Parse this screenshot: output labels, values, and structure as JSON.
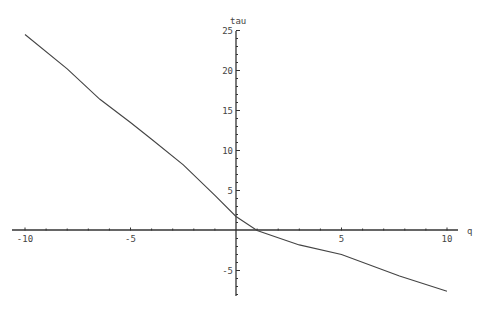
{
  "chart_data": {
    "type": "line",
    "title": "",
    "xlabel": "q",
    "ylabel": "tau",
    "xlim": [
      -10,
      10
    ],
    "ylim": [
      -8.5,
      25
    ],
    "x_ticks": [
      -10,
      -5,
      5,
      10
    ],
    "y_ticks": [
      -5,
      5,
      10,
      15,
      20,
      25
    ],
    "grid": false,
    "legend": null,
    "series": [
      {
        "name": "tau(q)",
        "color": "#444444",
        "x": [
          -10,
          -8,
          -6.45,
          -5,
          -4,
          -2.5,
          -1,
          0,
          1,
          2.1,
          3,
          5,
          7.75,
          10
        ],
        "y": [
          24.5,
          20.2,
          16.4,
          13.5,
          11.4,
          8.2,
          4.4,
          1.75,
          0,
          -1,
          -1.8,
          -3,
          -5.7,
          -7.6
        ]
      }
    ]
  },
  "labels": {
    "x_axis": "q",
    "y_axis": "tau",
    "x_tick_labels": [
      "-10",
      "-5",
      "5",
      "10"
    ],
    "y_tick_labels": [
      "-5",
      "5",
      "10",
      "15",
      "20",
      "25"
    ]
  }
}
